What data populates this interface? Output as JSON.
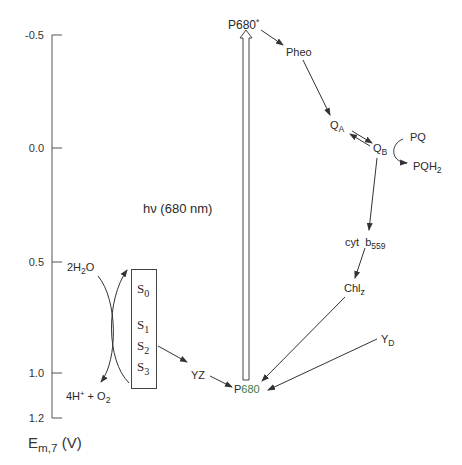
{
  "axis": {
    "title_main": "E",
    "title_sub": "m,7",
    "title_unit": " (V)",
    "ticks": [
      {
        "label": "-0.5",
        "value": -0.5
      },
      {
        "label": "0.0",
        "value": 0.0
      },
      {
        "label": "0.5",
        "value": 0.5
      },
      {
        "label": "1.0",
        "value": 1.0
      },
      {
        "label": "1.2",
        "value": 1.2
      }
    ]
  },
  "excitation": {
    "label": "hν (680 nm)"
  },
  "species": {
    "p680_star": "P680*",
    "p680_star_main": "P680",
    "p680_star_mark": "*",
    "pheo": "Pheo",
    "qa_main": "Q",
    "qa_sub": "A",
    "qb_main": "Q",
    "qb_sub": "B",
    "pq": "PQ",
    "pqh2_main": "PQH",
    "pqh2_sub": "2",
    "cyt_main": "cyt  b",
    "cyt_sub": "559",
    "chlz_main": "Chl",
    "chlz_sub": "z",
    "yd_main": "Y",
    "yd_sub": "D",
    "yz": "YZ",
    "p680_p": "P",
    "p680_num": "680"
  },
  "water": {
    "h2o_pre": "2H",
    "h2o_sub": "2",
    "h2o_post": "O",
    "products_pre": "4H",
    "products_sup": "+",
    "products_mid": " + O",
    "products_sub": "2"
  },
  "s_states": [
    {
      "main": "S",
      "sub": "0"
    },
    {
      "main": "S",
      "sub": "1"
    },
    {
      "main": "S",
      "sub": "2"
    },
    {
      "main": "S",
      "sub": "3"
    }
  ]
}
